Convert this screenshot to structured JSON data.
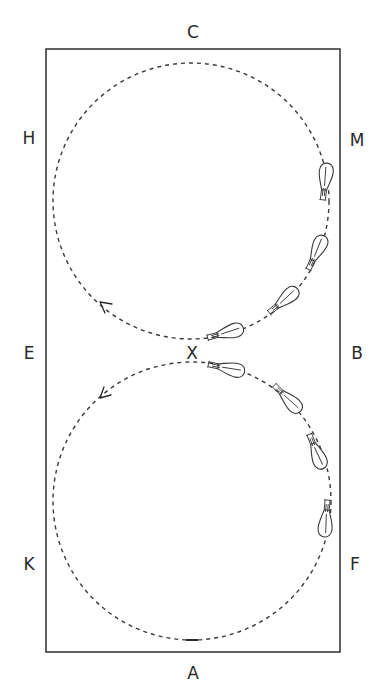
{
  "diagram": {
    "type": "dressage arena figure-of-eight (two circles meeting at X)",
    "arena": {
      "left": 46,
      "top": 49,
      "right": 340,
      "bottom": 652,
      "stroke_color": "#3a3a3a"
    },
    "markers": [
      {
        "id": "C",
        "label": "C",
        "x": 193,
        "y": 38
      },
      {
        "id": "H",
        "label": "H",
        "x": 29,
        "y": 144
      },
      {
        "id": "M",
        "label": "M",
        "x": 357,
        "y": 146
      },
      {
        "id": "E",
        "label": "E",
        "x": 29,
        "y": 359
      },
      {
        "id": "X",
        "label": "X",
        "x": 192,
        "y": 359
      },
      {
        "id": "B",
        "label": "B",
        "x": 357,
        "y": 359
      },
      {
        "id": "K",
        "label": "K",
        "x": 29,
        "y": 570
      },
      {
        "id": "F",
        "label": "F",
        "x": 355,
        "y": 570
      },
      {
        "id": "A",
        "label": "A",
        "x": 193,
        "y": 679
      }
    ],
    "circles": [
      {
        "name": "upper-circle",
        "cx": 191,
        "cy": 201,
        "r": 138
      },
      {
        "name": "lower-circle",
        "cx": 192,
        "cy": 501,
        "r": 139
      }
    ],
    "direction_arrows": [
      {
        "name": "upper-circle-direction",
        "x": 100,
        "y": 302,
        "pointing": "up-left"
      },
      {
        "name": "lower-circle-direction",
        "x": 100,
        "y": 398,
        "pointing": "down-left"
      }
    ],
    "horses": [
      {
        "name": "upper-horse-1",
        "x": 225,
        "y": 333,
        "angle": -15
      },
      {
        "name": "upper-horse-2",
        "x": 283,
        "y": 301,
        "angle": -40
      },
      {
        "name": "upper-horse-3",
        "x": 316,
        "y": 253,
        "angle": -65
      },
      {
        "name": "upper-horse-4",
        "x": 325,
        "y": 182,
        "angle": -83
      },
      {
        "name": "lower-horse-1",
        "x": 226,
        "y": 368,
        "angle": 12
      },
      {
        "name": "lower-horse-2",
        "x": 287,
        "y": 398,
        "angle": 45
      },
      {
        "name": "lower-horse-3",
        "x": 316,
        "y": 451,
        "angle": 68
      },
      {
        "name": "lower-horse-4",
        "x": 326,
        "y": 518,
        "angle": 95
      }
    ]
  }
}
